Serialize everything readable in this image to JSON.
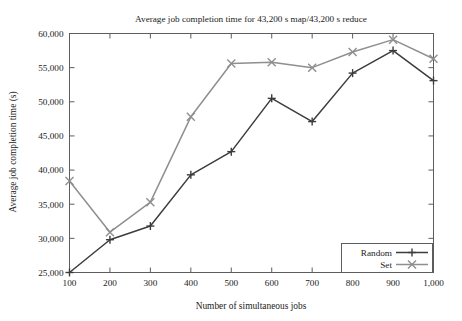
{
  "chart_data": {
    "type": "line",
    "title": "Average job completion time for 43,200 s map/43,200 s reduce",
    "xlabel": "Number of simultaneous jobs",
    "ylabel": "Average job completion time (s)",
    "x": [
      100,
      200,
      300,
      400,
      500,
      600,
      700,
      800,
      900,
      1000
    ],
    "xtick_labels": [
      "100",
      "200",
      "300",
      "400",
      "500",
      "600",
      "700",
      "800",
      "900",
      "1,000"
    ],
    "ytick_labels": [
      "25,000",
      "30,000",
      "35,000",
      "40,000",
      "45,000",
      "50,000",
      "55,000",
      "60,000"
    ],
    "ytick_values": [
      25000,
      30000,
      35000,
      40000,
      45000,
      50000,
      55000,
      60000
    ],
    "xlim": [
      100,
      1000
    ],
    "ylim": [
      25000,
      60000
    ],
    "grid": false,
    "legend_position": "bottom-right",
    "series": [
      {
        "name": "Random",
        "color": "#3c3c3c",
        "marker": "plus",
        "values": [
          25000,
          29800,
          31800,
          39300,
          42700,
          50500,
          47100,
          54200,
          57500,
          53100
        ]
      },
      {
        "name": "Set",
        "color": "#8f8f8f",
        "marker": "cross",
        "values": [
          38400,
          30900,
          35300,
          47800,
          55600,
          55800,
          55000,
          57300,
          59100,
          56300
        ]
      }
    ]
  },
  "legend": {
    "items": [
      {
        "label": "Random"
      },
      {
        "label": "Set"
      }
    ]
  },
  "colors": {
    "axis": "#5d5d5d",
    "text": "#1b1b1b",
    "background": "#ffffff",
    "random_series": "#3c3c3c",
    "set_series": "#8f8f8f"
  }
}
